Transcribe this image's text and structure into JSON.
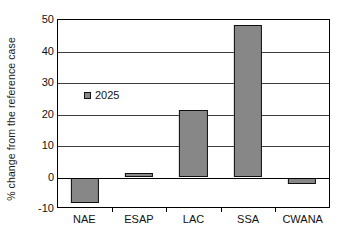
{
  "chart_data": {
    "type": "bar",
    "title": "",
    "subtitle": "",
    "xlabel": "",
    "ylabel": "% change from the reference case",
    "categories": [
      "NAE",
      "ESAP",
      "LAC",
      "SSA",
      "CWANA"
    ],
    "series": [
      {
        "name": "2025",
        "color": "#878787",
        "values": [
          -8.0,
          1.5,
          21.3,
          48.3,
          -2.2
        ]
      }
    ],
    "ylim": [
      -10,
      50
    ],
    "yticks": [
      50,
      40,
      30,
      20,
      10,
      0,
      -10
    ],
    "ytick_labels": [
      "50",
      "40",
      "30",
      "20",
      "10",
      "0",
      "-10"
    ],
    "grid": true,
    "grid_axis": "y",
    "legend": {
      "position": "inside-upper-left",
      "entries": [
        {
          "label": "2025",
          "marker": "filled-square",
          "color": "#878787"
        }
      ]
    },
    "zero_line": true,
    "bar_edge_color": "#111111",
    "axis_color": "#000000"
  }
}
